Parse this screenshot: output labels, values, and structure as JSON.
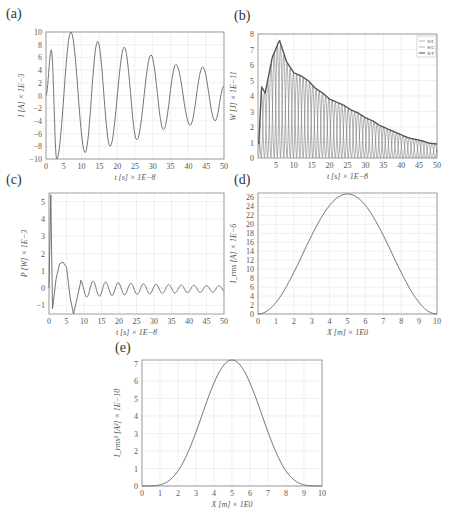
{
  "panels": {
    "a": {
      "label": "(a)"
    },
    "b": {
      "label": "(b)"
    },
    "c": {
      "label": "(c)"
    },
    "d": {
      "label": "(d)"
    },
    "e": {
      "label": "(e)"
    }
  },
  "chart_data": [
    {
      "id": "a",
      "type": "line",
      "title": "",
      "xlabel": "t [s] × 1E−8",
      "ylabel": "I [A] × 1E−3",
      "xlim": [
        0,
        50
      ],
      "ylim": [
        -10,
        10
      ],
      "xticks": [
        0,
        5,
        10,
        15,
        20,
        25,
        30,
        35,
        40,
        45,
        50
      ],
      "yticks": [
        -10,
        -8,
        -6,
        -4,
        -2,
        0,
        2,
        4,
        6,
        8,
        10
      ],
      "grid": true,
      "series": [
        {
          "name": "I",
          "peaks": [
            [
              1.5,
              7.2
            ],
            [
              3,
              -10
            ],
            [
              7,
              10
            ],
            [
              11,
              -9
            ],
            [
              14.5,
              8.5
            ],
            [
              18,
              -8
            ],
            [
              22,
              7.6
            ],
            [
              25.5,
              -7
            ],
            [
              29.5,
              6.4
            ],
            [
              33,
              -5.4
            ],
            [
              36.5,
              4.9
            ],
            [
              40.5,
              -4.7
            ],
            [
              44,
              4.5
            ],
            [
              47.5,
              -4
            ],
            [
              50,
              1.5
            ]
          ]
        }
      ]
    },
    {
      "id": "b",
      "type": "line",
      "title": "",
      "xlabel": "t [s] × 1E−8",
      "ylabel": "W [J] × 1E−11",
      "xlim": [
        0,
        50
      ],
      "ylim": [
        0,
        8
      ],
      "xticks": [
        5,
        10,
        15,
        20,
        25,
        30,
        35,
        40,
        45,
        50
      ],
      "yticks": [
        0,
        1,
        2,
        3,
        4,
        5,
        6,
        7,
        8
      ],
      "grid": true,
      "legend": [
        "W_L",
        "W_C",
        "W_T"
      ],
      "legend_position": "upper right",
      "series": [
        {
          "name": "W_T (envelope)",
          "x": [
            1,
            2,
            4,
            6,
            8,
            10,
            12,
            14,
            16,
            18,
            20,
            22,
            24,
            26,
            28,
            30,
            32,
            34,
            36,
            38,
            40,
            42,
            44,
            46,
            48,
            50
          ],
          "values": [
            4.6,
            4.2,
            6.5,
            7.6,
            6.2,
            5.5,
            5.3,
            5.0,
            4.5,
            4.2,
            3.8,
            3.6,
            3.4,
            3.1,
            2.9,
            2.6,
            2.4,
            2.1,
            1.9,
            1.7,
            1.5,
            1.3,
            1.2,
            1.1,
            0.95,
            0.9
          ]
        }
      ]
    },
    {
      "id": "c",
      "type": "line",
      "title": "",
      "xlabel": "t [s] × 1E−8",
      "ylabel": "P [W] × 1E−3",
      "xlim": [
        0,
        50
      ],
      "ylim": [
        -1.5,
        5.5
      ],
      "xticks": [
        0,
        5,
        10,
        15,
        20,
        25,
        30,
        35,
        40,
        45,
        50
      ],
      "yticks": [
        -1,
        0,
        1,
        2,
        3,
        4,
        5
      ],
      "grid": true,
      "series": [
        {
          "name": "P",
          "x": [
            0.5,
            1,
            2,
            4,
            5,
            7,
            9,
            10,
            12,
            13,
            15,
            17,
            20,
            25,
            30,
            35,
            40,
            45,
            50
          ],
          "values": [
            5.4,
            -1.2,
            0.5,
            1.5,
            1.4,
            -1.5,
            0.3,
            -0.4,
            0.4,
            -0.4,
            0.3,
            -0.3,
            0.25,
            0.2,
            0.15,
            0.15,
            0.1,
            0.1,
            0.05
          ]
        }
      ]
    },
    {
      "id": "d",
      "type": "line",
      "title": "",
      "xlabel": "X [m] × 1E0",
      "ylabel": "I_rms [A] × 1E−6",
      "xlim": [
        0,
        10
      ],
      "ylim": [
        0,
        27
      ],
      "xticks": [
        0,
        1,
        2,
        3,
        4,
        5,
        6,
        7,
        8,
        9,
        10
      ],
      "yticks": [
        0,
        2,
        4,
        6,
        8,
        10,
        12,
        14,
        16,
        18,
        20,
        22,
        24,
        26
      ],
      "grid": true,
      "series": [
        {
          "name": "I_rms",
          "x": [
            0,
            1,
            2,
            3,
            4,
            5,
            6,
            7,
            8,
            9,
            10
          ],
          "values": [
            0,
            4,
            10.5,
            17.5,
            23.5,
            26.8,
            23.5,
            17.5,
            10.5,
            4,
            0
          ]
        }
      ]
    },
    {
      "id": "e",
      "type": "line",
      "title": "",
      "xlabel": "X [m] × 1E0",
      "ylabel": "I_rms² [A²] × 1E−10",
      "xlim": [
        0,
        10
      ],
      "ylim": [
        0,
        7.2
      ],
      "xticks": [
        0,
        1,
        2,
        3,
        4,
        5,
        6,
        7,
        8,
        9,
        10
      ],
      "yticks": [
        0,
        1,
        2,
        3,
        4,
        5,
        6,
        7
      ],
      "grid": true,
      "series": [
        {
          "name": "I_rms²",
          "x": [
            0,
            1,
            2,
            3,
            4,
            5,
            6,
            7,
            8,
            9,
            10
          ],
          "values": [
            0,
            0.15,
            1.1,
            3.1,
            5.6,
            7.2,
            5.6,
            3.1,
            1.1,
            0.15,
            0
          ]
        }
      ]
    }
  ]
}
